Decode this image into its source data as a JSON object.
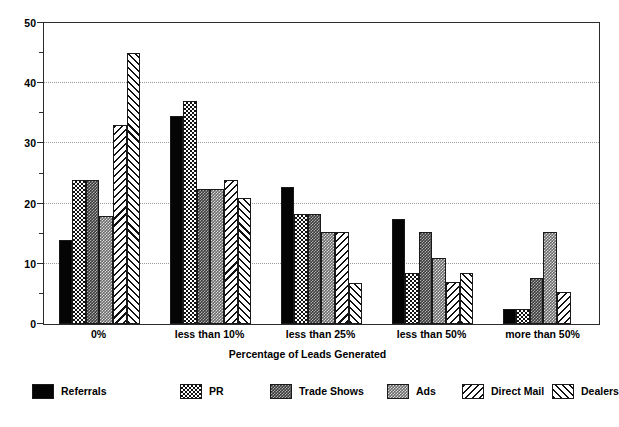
{
  "chart_data": {
    "type": "bar",
    "title": "",
    "xlabel": "Percentage of Leads Generated",
    "ylabel": "",
    "ylim": [
      0,
      50
    ],
    "ytick_values": [
      0,
      10,
      20,
      30,
      40,
      50
    ],
    "ytick_labels": [
      "0",
      "10",
      "20",
      "30",
      "40",
      "50"
    ],
    "yminor_tick_values": [
      5,
      15,
      25,
      35,
      45
    ],
    "grid": true,
    "grid_axis": "y",
    "legend_position": "bottom",
    "categories": [
      "0%",
      "less than 10%",
      "less than 25%",
      "less than 50%",
      "more than 50%"
    ],
    "series": [
      {
        "name": "Referrals",
        "pattern": "solid-black",
        "color": "#000000",
        "values": [
          14,
          34.5,
          22.7,
          17.5,
          2.5
        ]
      },
      {
        "name": "PR",
        "pattern": "checkerboard",
        "color": "#000000",
        "values": [
          24,
          37,
          18.3,
          8.5,
          2.5
        ]
      },
      {
        "name": "Trade Shows",
        "pattern": "dense-dark",
        "color": "#000000",
        "values": [
          24,
          22.5,
          18.3,
          15.3,
          7.7
        ]
      },
      {
        "name": "Ads",
        "pattern": "dense-medium",
        "color": "#000000",
        "values": [
          18,
          22.5,
          15.3,
          11,
          15.3
        ]
      },
      {
        "name": "Direct Mail",
        "pattern": "diagonal-forward",
        "color": "#000000",
        "values": [
          33,
          24,
          15.3,
          7,
          5.3
        ]
      },
      {
        "name": "Dealers",
        "pattern": "diagonal-back",
        "color": "#000000",
        "values": [
          45,
          21,
          6.8,
          8.5,
          0
        ]
      }
    ]
  },
  "axis": {
    "y_axis_name": "value-axis",
    "x_axis_name": "category-axis"
  }
}
